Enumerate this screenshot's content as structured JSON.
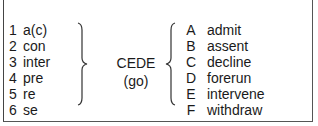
{
  "prefixes": [
    {
      "num": "1",
      "text": "a(c)"
    },
    {
      "num": "2",
      "text": "con"
    },
    {
      "num": "3",
      "text": "inter"
    },
    {
      "num": "4",
      "text": "pre"
    },
    {
      "num": "5",
      "text": "re"
    },
    {
      "num": "6",
      "text": "se"
    }
  ],
  "root": {
    "word": "CEDE",
    "meaning": "(go)"
  },
  "meanings": [
    {
      "letter": "A",
      "text": "admit"
    },
    {
      "letter": "B",
      "text": "assent"
    },
    {
      "letter": "C",
      "text": "decline"
    },
    {
      "letter": "D",
      "text": "forerun"
    },
    {
      "letter": "E",
      "text": "intervene"
    },
    {
      "letter": "F",
      "text": "withdraw"
    }
  ]
}
